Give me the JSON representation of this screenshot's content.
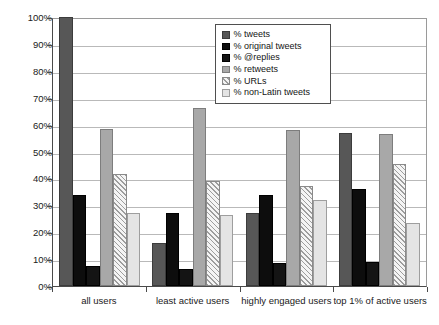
{
  "chart_data": {
    "type": "bar",
    "title": "",
    "xlabel": "",
    "ylabel": "",
    "ylim": [
      0,
      100
    ],
    "ytick_labels": [
      "100%",
      "90%",
      "80%",
      "70%",
      "60%",
      "50%",
      "40%",
      "30%",
      "20%",
      "10%",
      "0%"
    ],
    "ytick_values": [
      100,
      90,
      80,
      70,
      60,
      50,
      40,
      30,
      20,
      10,
      0
    ],
    "grid": true,
    "legend_position": "top-center",
    "categories": [
      "all users",
      "least active users",
      "highly engaged users",
      "top 1% of active users"
    ],
    "series": [
      {
        "name": "% tweets",
        "color": "#575757",
        "values": [
          100,
          16,
          27,
          57
        ]
      },
      {
        "name": "% original tweets",
        "color": "#0d0d0d",
        "values": [
          34,
          27,
          34,
          36
        ]
      },
      {
        "name": "% @replies",
        "color": "#141414",
        "values": [
          7.5,
          6.5,
          8.5,
          9
        ]
      },
      {
        "name": "% retweets",
        "color": "#a8a8a8",
        "values": [
          58.5,
          66,
          58,
          56.5
        ]
      },
      {
        "name": "% URLs",
        "color": "#f2f2f2",
        "values": [
          41.5,
          39,
          37,
          45.5
        ]
      },
      {
        "name": "% non-Latin tweets",
        "color": "#e4e4e4",
        "values": [
          27,
          26.5,
          32,
          23.5
        ]
      }
    ]
  },
  "legend": {
    "items": [
      {
        "label": "% tweets",
        "swatch": "swatch-dark-gray"
      },
      {
        "label": "% original tweets",
        "swatch": "swatch-black"
      },
      {
        "label": "% @replies",
        "swatch": "swatch-black"
      },
      {
        "label": "% retweets",
        "swatch": "swatch-mid-gray"
      },
      {
        "label": "% URLs",
        "swatch": "swatch-hatched"
      },
      {
        "label": "% non-Latin tweets",
        "swatch": "swatch-light-gray"
      }
    ]
  }
}
